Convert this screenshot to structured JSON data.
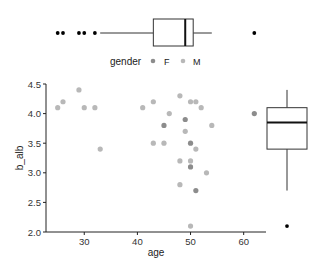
{
  "chart_data": {
    "type": "scatter",
    "title": "",
    "xlabel": "age",
    "ylabel": "b_alb",
    "xlim": [
      22.8,
      64.2
    ],
    "ylim": [
      2.0,
      4.5
    ],
    "x_ticks": [
      30,
      40,
      50,
      60
    ],
    "y_ticks": [
      2.0,
      2.5,
      3.0,
      3.5,
      4.0,
      4.5
    ],
    "y_tick_labels": [
      "2.0",
      "2.5",
      "3.0",
      "3.5",
      "4.0",
      "4.5"
    ],
    "grid": false,
    "legend": {
      "title": "gender",
      "position": "top",
      "entries": [
        {
          "label": "F",
          "color": "#8c8c8c"
        },
        {
          "label": "M",
          "color": "#b8b8b8"
        }
      ]
    },
    "series": [
      {
        "name": "F",
        "color": "#8c8c8c",
        "points": [
          [
            49,
            3.9
          ],
          [
            45,
            3.8
          ],
          [
            50,
            3.5
          ],
          [
            50,
            3.1
          ],
          [
            51,
            2.7
          ],
          [
            62,
            4.0
          ]
        ]
      },
      {
        "name": "M",
        "color": "#b8b8b8",
        "points": [
          [
            25,
            4.1
          ],
          [
            26,
            4.2
          ],
          [
            29,
            4.4
          ],
          [
            30,
            4.1
          ],
          [
            32,
            4.1
          ],
          [
            33,
            3.4
          ],
          [
            41,
            4.1
          ],
          [
            43,
            4.2
          ],
          [
            48,
            4.3
          ],
          [
            50,
            4.2
          ],
          [
            51,
            4.2
          ],
          [
            52,
            4.1
          ],
          [
            46,
            4.0
          ],
          [
            54,
            3.8
          ],
          [
            49,
            3.7
          ],
          [
            43,
            3.5
          ],
          [
            45,
            3.5
          ],
          [
            51,
            3.4
          ],
          [
            48,
            3.2
          ],
          [
            50,
            3.2
          ],
          [
            53,
            3.0
          ],
          [
            48,
            2.8
          ],
          [
            50,
            2.1
          ]
        ]
      }
    ],
    "marginal_boxplots": {
      "age": {
        "orientation": "horizontal",
        "position": "top",
        "lower_whisker": 33,
        "q1": 43,
        "median": 49,
        "q3": 50.5,
        "upper_whisker": 54,
        "outliers": [
          25,
          26,
          29,
          30,
          32,
          62
        ]
      },
      "b_alb": {
        "orientation": "vertical",
        "position": "right",
        "lower_whisker": 2.7,
        "q1": 3.4,
        "median": 3.85,
        "q3": 4.1,
        "upper_whisker": 4.4,
        "outliers": [
          2.1
        ]
      }
    }
  }
}
